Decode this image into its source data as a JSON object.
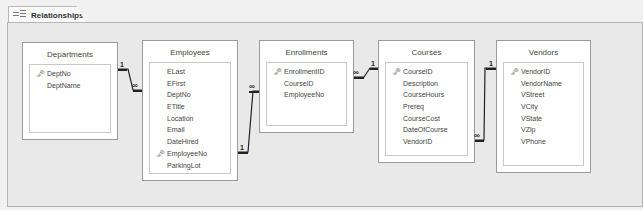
{
  "tab": {
    "label": "Relationships",
    "icon": "relationships-icon"
  },
  "tables": [
    {
      "name": "Departments",
      "fields": [
        {
          "name": "DeptNo",
          "key": true
        },
        {
          "name": "DeptName",
          "key": false
        }
      ]
    },
    {
      "name": "Employees",
      "fields": [
        {
          "name": "ELast",
          "key": false
        },
        {
          "name": "EFirst",
          "key": false
        },
        {
          "name": "DeptNo",
          "key": false
        },
        {
          "name": "ETitle",
          "key": false
        },
        {
          "name": "Location",
          "key": false
        },
        {
          "name": "Email",
          "key": false
        },
        {
          "name": "DateHired",
          "key": false
        },
        {
          "name": "EmployeeNo",
          "key": true
        },
        {
          "name": "ParkingLot",
          "key": false
        }
      ]
    },
    {
      "name": "Enrollments",
      "fields": [
        {
          "name": "EnrollmentID",
          "key": true
        },
        {
          "name": "CourseID",
          "key": false
        },
        {
          "name": "EmployeeNo",
          "key": false
        }
      ]
    },
    {
      "name": "Courses",
      "fields": [
        {
          "name": "CourseID",
          "key": true
        },
        {
          "name": "Description",
          "key": false
        },
        {
          "name": "CourseHours",
          "key": false
        },
        {
          "name": "Prereq",
          "key": false
        },
        {
          "name": "CourseCost",
          "key": false
        },
        {
          "name": "DateOfCourse",
          "key": false
        },
        {
          "name": "VendorID",
          "key": false
        }
      ]
    },
    {
      "name": "Vendors",
      "fields": [
        {
          "name": "VendorID",
          "key": true
        },
        {
          "name": "VendorName",
          "key": false
        },
        {
          "name": "VStreet",
          "key": false
        },
        {
          "name": "VCity",
          "key": false
        },
        {
          "name": "VState",
          "key": false
        },
        {
          "name": "VZip",
          "key": false
        },
        {
          "name": "VPhone",
          "key": false
        }
      ]
    }
  ],
  "relationships": [
    {
      "from": "Departments.DeptNo",
      "to": "Employees.DeptNo",
      "one": "1",
      "many": "∞"
    },
    {
      "from": "Employees.EmployeeNo",
      "to": "Enrollments.EmployeeNo",
      "one": "1",
      "many": "∞"
    },
    {
      "from": "Courses.CourseID",
      "to": "Enrollments.CourseID",
      "one": "1",
      "many": "∞"
    },
    {
      "from": "Vendors.VendorID",
      "to": "Courses.VendorID",
      "one": "1",
      "many": "∞"
    }
  ],
  "key_icon": "🗝"
}
